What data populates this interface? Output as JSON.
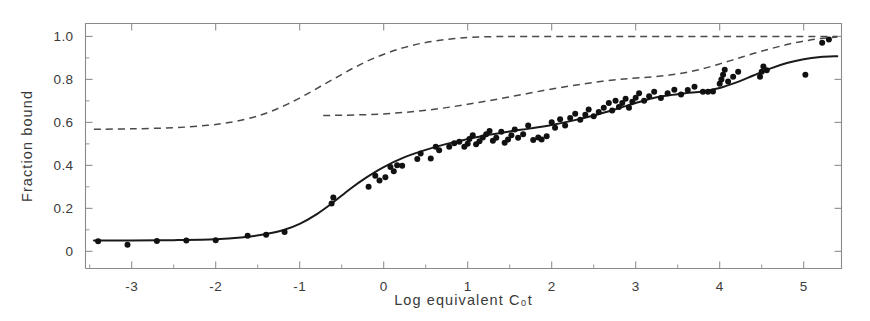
{
  "chart_data": {
    "type": "scatter",
    "title": "",
    "xlabel": "Log equivalent C₀t",
    "ylabel": "Fraction bound",
    "xlim": [
      -3.55,
      5.45
    ],
    "ylim": [
      1.06,
      -0.08
    ],
    "y_axis_inverted": true,
    "grid": false,
    "legend": null,
    "x_ticks": [
      -3,
      -2,
      -1,
      0,
      1,
      2,
      3,
      4,
      5
    ],
    "x_tick_labels": [
      "-3",
      "-2",
      "-1",
      "0",
      "1",
      "2",
      "3",
      "4",
      "5"
    ],
    "x_minor_ticks": [
      -3.5,
      -2.5,
      -1.5,
      -0.5,
      0.5,
      1.5,
      2.5,
      3.5,
      4.5
    ],
    "y_ticks": [
      0,
      0.2,
      0.4,
      0.6,
      0.8,
      1.0
    ],
    "y_tick_labels": [
      "0",
      "0.2",
      "0.4",
      "0.6",
      "0.8",
      "1.0"
    ],
    "y_minor_ticks": [
      0.1,
      0.3,
      0.5,
      0.7,
      0.9
    ],
    "series": [
      {
        "name": "observed data points",
        "type": "scatter",
        "marker": "filled-circle",
        "color": "#111111",
        "points": [
          [
            -3.4,
            0.047
          ],
          [
            -3.05,
            0.03
          ],
          [
            -2.7,
            0.048
          ],
          [
            -2.35,
            0.05
          ],
          [
            -2.0,
            0.052
          ],
          [
            -1.62,
            0.072
          ],
          [
            -1.4,
            0.077
          ],
          [
            -1.18,
            0.09
          ],
          [
            -0.62,
            0.223
          ],
          [
            -0.6,
            0.25
          ],
          [
            -0.18,
            0.3
          ],
          [
            -0.1,
            0.352
          ],
          [
            -0.05,
            0.33
          ],
          [
            0.02,
            0.345
          ],
          [
            0.08,
            0.392
          ],
          [
            0.12,
            0.372
          ],
          [
            0.16,
            0.4
          ],
          [
            0.22,
            0.398
          ],
          [
            0.4,
            0.43
          ],
          [
            0.44,
            0.455
          ],
          [
            0.56,
            0.432
          ],
          [
            0.62,
            0.486
          ],
          [
            0.66,
            0.47
          ],
          [
            0.78,
            0.487
          ],
          [
            0.84,
            0.503
          ],
          [
            0.9,
            0.51
          ],
          [
            0.96,
            0.487
          ],
          [
            1.0,
            0.5
          ],
          [
            1.02,
            0.523
          ],
          [
            1.06,
            0.54
          ],
          [
            1.1,
            0.498
          ],
          [
            1.14,
            0.512
          ],
          [
            1.18,
            0.53
          ],
          [
            1.22,
            0.545
          ],
          [
            1.26,
            0.56
          ],
          [
            1.3,
            0.515
          ],
          [
            1.34,
            0.528
          ],
          [
            1.4,
            0.556
          ],
          [
            1.44,
            0.505
          ],
          [
            1.48,
            0.52
          ],
          [
            1.52,
            0.54
          ],
          [
            1.56,
            0.567
          ],
          [
            1.6,
            0.528
          ],
          [
            1.66,
            0.545
          ],
          [
            1.72,
            0.585
          ],
          [
            1.78,
            0.518
          ],
          [
            1.84,
            0.53
          ],
          [
            1.88,
            0.52
          ],
          [
            1.94,
            0.535
          ],
          [
            2.0,
            0.6
          ],
          [
            2.04,
            0.575
          ],
          [
            2.1,
            0.615
          ],
          [
            2.16,
            0.585
          ],
          [
            2.22,
            0.62
          ],
          [
            2.28,
            0.64
          ],
          [
            2.34,
            0.612
          ],
          [
            2.4,
            0.635
          ],
          [
            2.44,
            0.66
          ],
          [
            2.5,
            0.628
          ],
          [
            2.56,
            0.648
          ],
          [
            2.62,
            0.668
          ],
          [
            2.68,
            0.69
          ],
          [
            2.72,
            0.655
          ],
          [
            2.76,
            0.7
          ],
          [
            2.8,
            0.672
          ],
          [
            2.84,
            0.69
          ],
          [
            2.88,
            0.71
          ],
          [
            2.92,
            0.668
          ],
          [
            2.96,
            0.696
          ],
          [
            3.0,
            0.715
          ],
          [
            3.04,
            0.735
          ],
          [
            3.1,
            0.7
          ],
          [
            3.16,
            0.722
          ],
          [
            3.22,
            0.742
          ],
          [
            3.3,
            0.713
          ],
          [
            3.38,
            0.735
          ],
          [
            3.46,
            0.752
          ],
          [
            3.54,
            0.73
          ],
          [
            3.62,
            0.75
          ],
          [
            3.7,
            0.766
          ],
          [
            3.8,
            0.742
          ],
          [
            3.86,
            0.742
          ],
          [
            3.92,
            0.744
          ],
          [
            4.0,
            0.78
          ],
          [
            4.02,
            0.8
          ],
          [
            4.04,
            0.822
          ],
          [
            4.06,
            0.845
          ],
          [
            4.1,
            0.79
          ],
          [
            4.16,
            0.812
          ],
          [
            4.22,
            0.836
          ],
          [
            4.48,
            0.812
          ],
          [
            4.5,
            0.836
          ],
          [
            4.52,
            0.86
          ],
          [
            4.56,
            0.842
          ],
          [
            5.02,
            0.822
          ],
          [
            5.22,
            0.97
          ],
          [
            5.3,
            0.985
          ]
        ]
      },
      {
        "name": "total fitted curve",
        "type": "line",
        "style": "solid",
        "color": "#1a1a1a",
        "points": [
          [
            -3.45,
            0.05
          ],
          [
            -3.0,
            0.05
          ],
          [
            -2.5,
            0.052
          ],
          [
            -2.0,
            0.056
          ],
          [
            -1.7,
            0.064
          ],
          [
            -1.4,
            0.08
          ],
          [
            -1.2,
            0.098
          ],
          [
            -1.0,
            0.128
          ],
          [
            -0.8,
            0.172
          ],
          [
            -0.6,
            0.228
          ],
          [
            -0.4,
            0.29
          ],
          [
            -0.2,
            0.345
          ],
          [
            0.0,
            0.392
          ],
          [
            0.25,
            0.438
          ],
          [
            0.5,
            0.472
          ],
          [
            0.75,
            0.5
          ],
          [
            1.0,
            0.522
          ],
          [
            1.25,
            0.542
          ],
          [
            1.5,
            0.558
          ],
          [
            1.75,
            0.572
          ],
          [
            2.0,
            0.588
          ],
          [
            2.25,
            0.608
          ],
          [
            2.5,
            0.632
          ],
          [
            2.75,
            0.66
          ],
          [
            3.0,
            0.69
          ],
          [
            3.2,
            0.712
          ],
          [
            3.4,
            0.726
          ],
          [
            3.6,
            0.736
          ],
          [
            3.8,
            0.744
          ],
          [
            4.0,
            0.76
          ],
          [
            4.2,
            0.786
          ],
          [
            4.4,
            0.818
          ],
          [
            4.6,
            0.85
          ],
          [
            4.8,
            0.876
          ],
          [
            5.0,
            0.894
          ],
          [
            5.2,
            0.904
          ],
          [
            5.4,
            0.908
          ]
        ]
      },
      {
        "name": "component curve 1 (fast fraction)",
        "type": "line",
        "style": "dashed",
        "color": "#4a4a4a",
        "points": [
          [
            -3.45,
            0.568
          ],
          [
            -3.0,
            0.57
          ],
          [
            -2.5,
            0.575
          ],
          [
            -2.1,
            0.586
          ],
          [
            -1.8,
            0.602
          ],
          [
            -1.55,
            0.624
          ],
          [
            -1.35,
            0.65
          ],
          [
            -1.15,
            0.684
          ],
          [
            -0.95,
            0.724
          ],
          [
            -0.75,
            0.768
          ],
          [
            -0.55,
            0.812
          ],
          [
            -0.35,
            0.855
          ],
          [
            -0.15,
            0.893
          ],
          [
            0.05,
            0.924
          ],
          [
            0.25,
            0.949
          ],
          [
            0.45,
            0.968
          ],
          [
            0.65,
            0.981
          ],
          [
            0.85,
            0.99
          ],
          [
            1.05,
            0.996
          ],
          [
            1.3,
            0.999
          ],
          [
            1.6,
            1.0
          ],
          [
            2.2,
            1.0
          ],
          [
            3.0,
            1.0
          ],
          [
            4.0,
            1.0
          ],
          [
            5.0,
            1.0
          ],
          [
            5.4,
            1.0
          ]
        ]
      },
      {
        "name": "component curve 2 (slow fraction)",
        "type": "line",
        "style": "dashed",
        "color": "#4a4a4a",
        "points": [
          [
            -0.72,
            0.632
          ],
          [
            -0.5,
            0.633
          ],
          [
            -0.2,
            0.636
          ],
          [
            0.1,
            0.642
          ],
          [
            0.4,
            0.652
          ],
          [
            0.7,
            0.666
          ],
          [
            1.0,
            0.684
          ],
          [
            1.3,
            0.704
          ],
          [
            1.6,
            0.726
          ],
          [
            1.9,
            0.748
          ],
          [
            2.2,
            0.768
          ],
          [
            2.5,
            0.786
          ],
          [
            2.8,
            0.8
          ],
          [
            3.0,
            0.806
          ],
          [
            3.2,
            0.812
          ],
          [
            3.4,
            0.82
          ],
          [
            3.6,
            0.832
          ],
          [
            3.8,
            0.85
          ],
          [
            4.0,
            0.872
          ],
          [
            4.2,
            0.896
          ],
          [
            4.4,
            0.92
          ],
          [
            4.6,
            0.942
          ],
          [
            4.8,
            0.962
          ],
          [
            5.0,
            0.978
          ],
          [
            5.2,
            0.99
          ],
          [
            5.4,
            0.997
          ]
        ]
      }
    ]
  }
}
